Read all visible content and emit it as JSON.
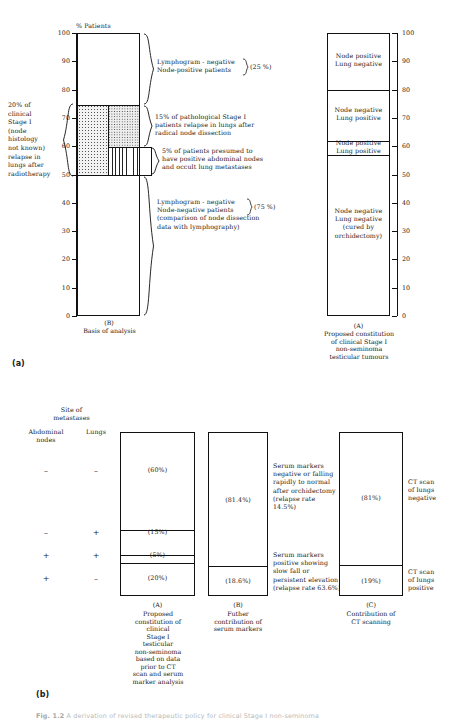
{
  "figure": {
    "caption_label": "Fig. 1.2",
    "caption_text": "A derivation of revised therapeutic policy for clinical Stage I non-seminoma"
  },
  "panel_a": {
    "letter": "(a)",
    "y_axis_title": "% Patients",
    "y_ticks": [
      0,
      10,
      20,
      30,
      40,
      50,
      60,
      70,
      80,
      90,
      100
    ],
    "y_min": 0,
    "y_max": 100,
    "left_note": "20% of clinical Stage I (node histology not known) relapse in lungs after radiotherapy",
    "left_note_lines": [
      "20% of",
      "clinical",
      "Stage I",
      "(node",
      "histology",
      "not known)",
      "relapse in",
      "lungs after",
      "radiotherapy"
    ],
    "chart_B": {
      "letter": "(B)",
      "caption": "Basis of analysis",
      "annotations": [
        {
          "lines": [
            "Lymphogram - negative",
            "Node-positive patients"
          ],
          "value": "(25 %)",
          "from": 75,
          "to": 100
        },
        {
          "lines": [
            "15% of pathological Stage I",
            "patients relapse in lungs after",
            "radical node dissection"
          ],
          "value": "",
          "from": 60,
          "to": 75
        },
        {
          "lines": [
            "5% of patients presumed to",
            "have positive abdominal nodes",
            "and occult lung metastases"
          ],
          "value": "",
          "from": 55,
          "to": 60
        },
        {
          "lines": [
            "Lymphogram - negative",
            "Node-negative patients",
            "(comparison of node dissection",
            "data with lymphography)"
          ],
          "value": "(75 %)",
          "from": 0,
          "to": 75
        }
      ]
    },
    "chart_A": {
      "letter": "(A)",
      "caption_lines": [
        "Proposed constitution",
        "of clinical Stage I",
        "non-seminoma",
        "testicular tumours"
      ],
      "segments": [
        {
          "label_lines": [
            "Node positive",
            "Lung negative"
          ],
          "from": 80,
          "to": 100
        },
        {
          "label_lines": [
            "Node negative",
            "Lung positive"
          ],
          "from": 62,
          "to": 80
        },
        {
          "label_lines": [
            "Node positive",
            "Lung positive"
          ],
          "from": 57,
          "to": 62
        },
        {
          "label_lines": [
            "Node negative",
            "Lung negative",
            "(cured by",
            "orchidectomy)"
          ],
          "from": 0,
          "to": 57
        }
      ]
    }
  },
  "panel_b": {
    "letter": "(b)",
    "header": {
      "site_title_lines": [
        "Site of",
        "metastases"
      ],
      "col1": "Abdominal nodes",
      "col1_lines": [
        "Abdominal",
        "nodes"
      ],
      "col2": "Lungs"
    },
    "rows": [
      {
        "nodes": "–",
        "lungs": "–",
        "value": "(60%)"
      },
      {
        "nodes": "–",
        "lungs": "+",
        "value": "(15%)"
      },
      {
        "nodes": "+",
        "lungs": "+",
        "value": "(5%)"
      },
      {
        "nodes": "+",
        "lungs": "–",
        "value": "(20%)"
      }
    ],
    "chart_A": {
      "letter": "(A)",
      "caption_lines": [
        "Proposed",
        "constitution of",
        "clinical",
        "Stage I",
        "testicular",
        "non-seminoma",
        "based on data",
        "prior to CT",
        "scan and serum",
        "marker analysis"
      ],
      "segments": [
        {
          "value": "(60%)",
          "pct": 60
        },
        {
          "value": "(15%)",
          "pct": 15
        },
        {
          "value": "(5%)",
          "pct": 5
        },
        {
          "value": "(20%)",
          "pct": 20
        }
      ]
    },
    "chart_B": {
      "letter": "(B)",
      "caption_lines": [
        "Futher",
        "contribution of",
        "serum markers"
      ],
      "segments": [
        {
          "value": "(81.4%)",
          "pct": 81.4,
          "note_lines": [
            "Serum markers",
            "negative or falling",
            "rapidly to normal",
            "after orchidectomy",
            "(relapse rate",
            "14.5%)"
          ]
        },
        {
          "value": "(18.6%)",
          "pct": 18.6,
          "note_lines": [
            "Serum markers",
            "positive showing",
            "slow fall or",
            "persistent elevation",
            "(relapse rate 63.6%)"
          ]
        }
      ]
    },
    "chart_C": {
      "letter": "(C)",
      "caption_lines": [
        "Contribution of",
        "CT scanning"
      ],
      "segments": [
        {
          "value": "(81%)",
          "pct": 81,
          "note_lines": [
            "CT scan",
            "of lungs",
            "negative"
          ]
        },
        {
          "value": "(19%)",
          "pct": 19,
          "note_lines": [
            "CT scan",
            "of lungs",
            "positive"
          ]
        }
      ]
    }
  }
}
